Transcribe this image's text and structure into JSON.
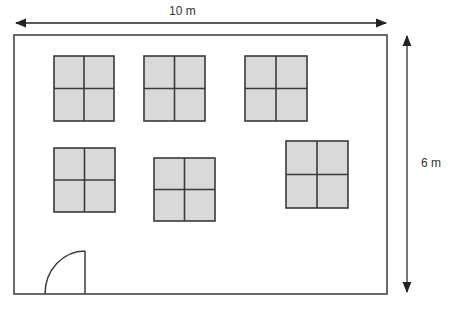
{
  "diagram": {
    "width_label": "10 m",
    "height_label": "6 m",
    "colors": {
      "stroke": "#3a3a3a",
      "window_fill": "#d9d9d9",
      "arrow": "#222222"
    },
    "room": {
      "x": 14,
      "y": 35,
      "w": 373,
      "h": 259
    },
    "windows": [
      {
        "id": "window-1",
        "x": 54,
        "y": 56,
        "w": 60,
        "h": 65
      },
      {
        "id": "window-2",
        "x": 144,
        "y": 56,
        "w": 61,
        "h": 65
      },
      {
        "id": "window-3",
        "x": 245,
        "y": 56,
        "w": 62,
        "h": 65
      },
      {
        "id": "window-4",
        "x": 54,
        "y": 148,
        "w": 61,
        "h": 64
      },
      {
        "id": "window-5",
        "x": 154,
        "y": 158,
        "w": 61,
        "h": 63
      },
      {
        "id": "window-6",
        "x": 286,
        "y": 141,
        "w": 62,
        "h": 67
      }
    ],
    "door": {
      "hinge_x": 85,
      "hinge_y": 294,
      "radius": 40
    }
  }
}
